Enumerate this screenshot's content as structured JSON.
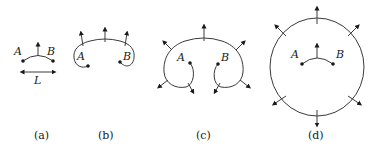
{
  "figure": {
    "panels": [
      {
        "caption": "(a)",
        "point_a": "A",
        "point_b": "B",
        "length_label": "L"
      },
      {
        "caption": "(b)",
        "point_a": "A",
        "point_b": "B"
      },
      {
        "caption": "(c)",
        "point_a": "A",
        "point_b": "B"
      },
      {
        "caption": "(d)",
        "point_a": "A",
        "point_b": "B"
      }
    ],
    "colors": {
      "stroke": "#3a3a3a",
      "text": "#1a1a1a",
      "background": "#ffffff"
    }
  }
}
